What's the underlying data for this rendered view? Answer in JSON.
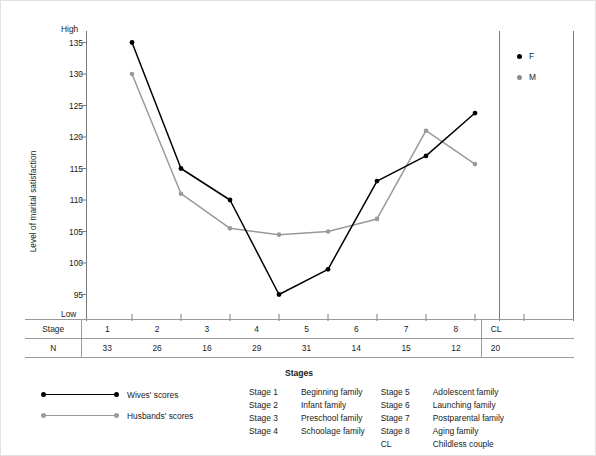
{
  "axes": {
    "y_title": "Level of marital satisfaction",
    "y_high_label": "High",
    "y_low_label": "Low",
    "y_ticks": [
      "135",
      "130",
      "125",
      "120",
      "115",
      "110",
      "105",
      "100",
      "95"
    ],
    "x_title": "Stages"
  },
  "legend_fm": {
    "f_label": "F",
    "m_label": "M"
  },
  "series_key": {
    "f_label": "Wives' scores",
    "m_label": "Husbands' scores"
  },
  "table": {
    "stage_row_header": "Stage",
    "n_row_header": "N",
    "stages": [
      "1",
      "2",
      "3",
      "4",
      "5",
      "6",
      "7",
      "8"
    ],
    "n_values": [
      "33",
      "26",
      "16",
      "29",
      "31",
      "14",
      "15",
      "12"
    ],
    "cl_stage": "CL",
    "cl_n": "20"
  },
  "stage_definitions": {
    "left": [
      {
        "key": "Stage 1",
        "value": "Beginning family"
      },
      {
        "key": "Stage 2",
        "value": "Infant family"
      },
      {
        "key": "Stage 3",
        "value": "Preschool family"
      },
      {
        "key": "Stage 4",
        "value": "Schoolage family"
      }
    ],
    "right": [
      {
        "key": "Stage 5",
        "value": "Adolescent family"
      },
      {
        "key": "Stage 6",
        "value": "Launching family"
      },
      {
        "key": "Stage 7",
        "value": "Postparental family"
      },
      {
        "key": "Stage 8",
        "value": "Aging family"
      },
      {
        "key": "CL",
        "value": "Childless couple"
      }
    ]
  },
  "colors": {
    "f_series": "#000000",
    "m_series": "#9a9a9a",
    "axis": "#7a7a7a",
    "rule": "#9a9a9a"
  },
  "chart_data": {
    "type": "line",
    "title": "",
    "xlabel": "Stages",
    "ylabel": "Level of marital satisfaction",
    "categories": [
      "1",
      "2",
      "3",
      "4",
      "5",
      "6",
      "7",
      "8"
    ],
    "ylim": [
      95,
      135
    ],
    "ytick_values": [
      95,
      100,
      105,
      110,
      115,
      120,
      125,
      130,
      135
    ],
    "grid": false,
    "legend_position": "top-right",
    "series": [
      {
        "name": "F",
        "long_name": "Wives' scores",
        "color": "#000000",
        "values": [
          135,
          115,
          110,
          95,
          99,
          113,
          117,
          123.8
        ]
      },
      {
        "name": "M",
        "long_name": "Husbands' scores",
        "color": "#9a9a9a",
        "values": [
          130,
          111,
          105.5,
          104.5,
          105,
          107,
          121,
          115.7
        ]
      }
    ],
    "sample_sizes": {
      "1": 33,
      "2": 26,
      "3": 16,
      "4": 29,
      "5": 31,
      "6": 14,
      "7": 15,
      "8": 12,
      "CL": 20
    }
  }
}
